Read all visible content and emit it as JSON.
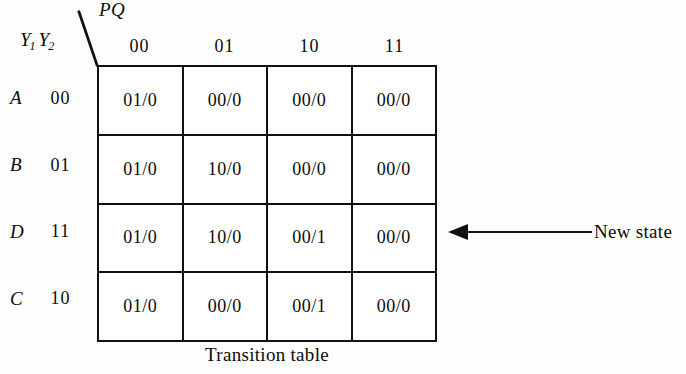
{
  "figure": {
    "caption": "Transition table",
    "background_color": "#fdfdfd",
    "line_color": "#111111",
    "text_color": "#0b0b0b"
  },
  "axes": {
    "column_axis_label": "PQ",
    "row_axis_label_main": "Y",
    "row_axis_sub_1": "1",
    "row_axis_label_second": "Y",
    "row_axis_sub_2": "2"
  },
  "table": {
    "column_headers": [
      "00",
      "01",
      "10",
      "11"
    ],
    "row_states": [
      "A",
      "B",
      "D",
      "C"
    ],
    "row_codes": [
      "00",
      "01",
      "11",
      "10"
    ],
    "rows": [
      {
        "state": "A",
        "code": "00",
        "cells": [
          "01/0",
          "00/0",
          "00/0",
          "00/0"
        ]
      },
      {
        "state": "B",
        "code": "01",
        "cells": [
          "01/0",
          "10/0",
          "00/0",
          "00/0"
        ]
      },
      {
        "state": "D",
        "code": "11",
        "cells": [
          "01/0",
          "10/0",
          "00/1",
          "00/0"
        ]
      },
      {
        "state": "C",
        "code": "10",
        "cells": [
          "01/0",
          "00/0",
          "00/1",
          "00/0"
        ]
      }
    ]
  },
  "annotation": {
    "label": "New state",
    "points_to_row": "D",
    "points_to_column": "11"
  }
}
